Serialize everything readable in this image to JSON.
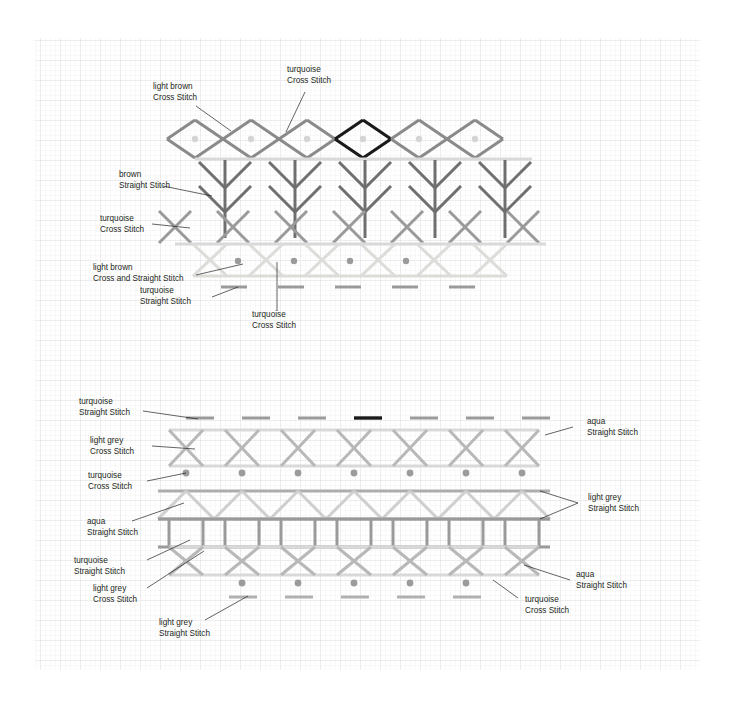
{
  "diagram": {
    "type": "stitch-chart",
    "grid": {
      "x": 35,
      "y": 38,
      "width": 665,
      "height": 632,
      "minor_cell_px": 5,
      "major_every": 4,
      "minor_color": "#f0f0f2",
      "major_color": "#e2e2e6"
    },
    "palette": {
      "brown": "#6f6f6f",
      "light_brown": "#cfcfcb",
      "turquoise": "#9a9a9a",
      "aqua": "#b3b3b3",
      "light_grey": "#d9d9d9",
      "dark_grey": "#8a8a8a",
      "highlight_black": "#1a1a1a",
      "dot": "#d5d5d5",
      "dot_dark": "#9b9b9b",
      "text": "#231f20"
    }
  },
  "annotations": {
    "a1": {
      "line1": "light brown",
      "line2": "Cross Stitch"
    },
    "a2": {
      "line1": "turquoise",
      "line2": "Cross Stitch"
    },
    "a3": {
      "line1": "brown",
      "line2": "Straight Stitch"
    },
    "a4": {
      "line1": "turquoise",
      "line2": "Cross Stitch"
    },
    "a5": {
      "line1": "light brown",
      "line2": "Cross and Straight Stitch"
    },
    "a6": {
      "line1": "turquoise",
      "line2": "Straight Stitch"
    },
    "a7": {
      "line1": "turquoise",
      "line2": "Cross Stitch"
    },
    "b1": {
      "line1": "turquoise",
      "line2": "Straight Stitch"
    },
    "b2": {
      "line1": "aqua",
      "line2": "Straight Stitch"
    },
    "b3": {
      "line1": "light grey",
      "line2": "Cross Stitch"
    },
    "b4": {
      "line1": "turquoise",
      "line2": "Cross Stitch"
    },
    "b5": {
      "line1": "light grey",
      "line2": "Straight Stitch"
    },
    "b6": {
      "line1": "aqua",
      "line2": "Straight Stitch"
    },
    "b7": {
      "line1": "turquoise",
      "line2": "Straight Stitch"
    },
    "b8": {
      "line1": "aqua",
      "line2": "Straight Stitch"
    },
    "b9": {
      "line1": "light grey",
      "line2": "Cross Stitch"
    },
    "b10": {
      "line1": "turquoise",
      "line2": "Cross Stitch"
    },
    "b11": {
      "line1": "light grey",
      "line2": "Straight Stitch"
    }
  },
  "chart_data": {
    "type": "stitch-chart",
    "bands": [
      {
        "id": "band-diamonds",
        "name": "diamond cross-stitch row",
        "color_label": "light brown / turquoise",
        "stroke": "#8a8a8a",
        "highlight_stroke": "#1a1a1a",
        "y_top": 120,
        "y_bottom": 158,
        "x_start": 195,
        "pitch": 56,
        "count": 6,
        "highlight_index": 3,
        "dots": {
          "color": "#d5d5d5",
          "r": 3.2,
          "cy": 139
        }
      },
      {
        "id": "band-baseline-1",
        "name": "light brown straight stitch baseline",
        "stroke": "#d9d9d9",
        "y": 159,
        "x1": 195,
        "x2": 532
      },
      {
        "id": "band-trees",
        "name": "brown straight stitch tree motif row",
        "stroke": "#6f6f6f",
        "y_top": 160,
        "y_bottom": 238,
        "x_start": 225,
        "pitch": 70,
        "count": 5
      },
      {
        "id": "band-crosses-1",
        "name": "turquoise cross stitch row",
        "stroke": "#9a9a9a",
        "y_top": 211,
        "y_bottom": 243,
        "x_start": 175,
        "pitch": 58,
        "count": 7
      },
      {
        "id": "band-baseline-2",
        "name": "light brown straight stitch baseline",
        "stroke": "#d9d9d9",
        "y": 244,
        "x1": 175,
        "x2": 546
      },
      {
        "id": "band-crosses-2",
        "name": "light brown cross and straight stitch row",
        "stroke": "#dcdcd8",
        "y_top": 244,
        "y_bottom": 276,
        "x_start": 210,
        "pitch": 56,
        "count": 6,
        "dots": {
          "color": "#9b9b9b",
          "r": 3.2,
          "cy": 261
        }
      },
      {
        "id": "band-dashes-1",
        "name": "turquoise straight stitch dashes",
        "stroke": "#9a9a9a",
        "y": 287,
        "x_start": 221,
        "pitch": 57,
        "length": 26,
        "count": 5
      },
      {
        "id": "band-dashes-2",
        "name": "turquoise straight stitch dashes upper lower-block",
        "stroke": "#9a9a9a",
        "highlight_stroke": "#1a1a1a",
        "y": 418,
        "x_start": 186,
        "pitch": 56,
        "length": 28,
        "count": 7,
        "highlight_index": 3
      },
      {
        "id": "band-crosses-3",
        "name": "light grey cross stitch row with aqua straight stitch rails",
        "stroke": "#b8b8b8",
        "rail_stroke": "#d9d9d9",
        "y_top": 430,
        "y_bottom": 466,
        "x_start": 186,
        "pitch": 56,
        "count": 7
      },
      {
        "id": "band-dots-1",
        "name": "turquoise cross stitch dot row",
        "dot_color": "#9b9b9b",
        "r": 3.4,
        "cy": 473,
        "x_start": 186,
        "pitch": 56,
        "count": 7
      },
      {
        "id": "band-zigzag",
        "name": "aqua straight stitch zigzag band",
        "stroke": "#cfcfcf",
        "rail_stroke": "#adadad",
        "y_top": 491,
        "y_bottom": 519,
        "x_start": 186,
        "pitch": 56,
        "count": 7
      },
      {
        "id": "band-boxes",
        "name": "turquoise straight stitch box row",
        "stroke": "#9a9a9a",
        "y_top": 519,
        "y_bottom": 547,
        "x_start": 186,
        "pitch": 56,
        "count": 7
      },
      {
        "id": "band-crosses-4",
        "name": "light grey cross stitch row lower",
        "stroke": "#b8b8b8",
        "rail_stroke": "#d9d9d9",
        "y_top": 547,
        "y_bottom": 575,
        "x_start": 186,
        "pitch": 56,
        "count": 7
      },
      {
        "id": "band-dots-2",
        "name": "turquoise cross stitch dot row lower",
        "dot_color": "#9b9b9b",
        "r": 3.4,
        "cy": 583,
        "x_start": 242,
        "pitch": 56,
        "count": 5
      },
      {
        "id": "band-dashes-3",
        "name": "light grey straight stitch dashes lower",
        "stroke": "#b0b0b0",
        "y": 597,
        "x_start": 229,
        "pitch": 56,
        "length": 28,
        "count": 5
      }
    ]
  }
}
